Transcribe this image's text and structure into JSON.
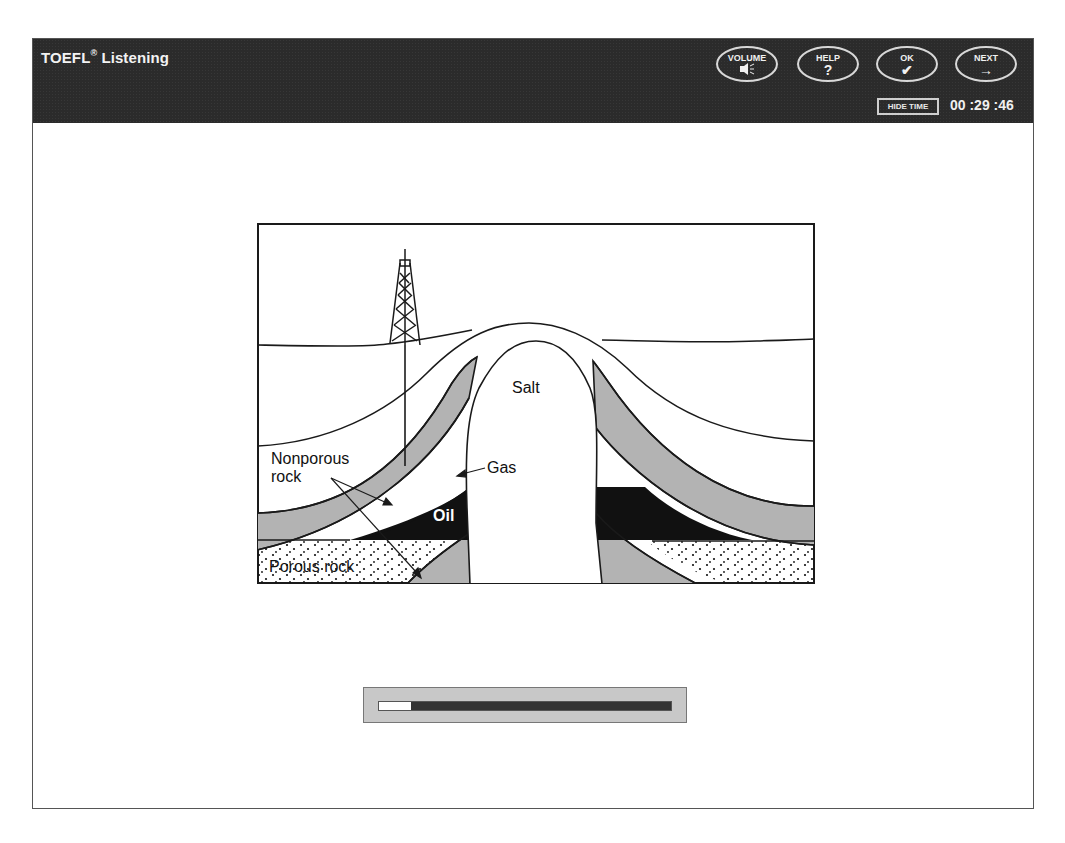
{
  "header": {
    "title": "TOEFL",
    "title_mark": "®",
    "title_suffix": " Listening",
    "buttons": [
      {
        "label": "VOLUME",
        "icon": "speaker-icon",
        "glyph": "◀≡"
      },
      {
        "label": "HELP",
        "icon": "question-icon",
        "glyph": "?"
      },
      {
        "label": "OK",
        "icon": "checkmark-icon",
        "glyph": "✔"
      },
      {
        "label": "NEXT",
        "icon": "arrow-right-icon",
        "glyph": "→"
      }
    ],
    "hide_time_label": "HIDE TIME",
    "timer": "00 :29 :46"
  },
  "diagram": {
    "labels": {
      "salt": "Salt",
      "gas": "Gas",
      "oil": "Oil",
      "nonporous_line1": "Nonporous",
      "nonporous_line2": "rock",
      "porous": "Porous rock"
    },
    "colors": {
      "gray_layer": "#b3b3b3",
      "oil": "#111111",
      "outline": "#1a1a1a"
    }
  },
  "progress": {
    "percent": 11
  },
  "colors": {
    "header_bg": "#2b2b2b",
    "frame_border": "#555555",
    "progress_bg": "#c8c8c8",
    "progress_track": "#333333"
  }
}
